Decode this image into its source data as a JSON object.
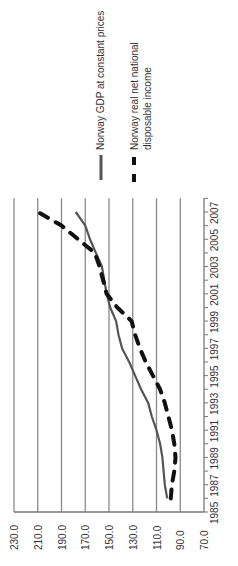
{
  "chart_data": {
    "type": "line",
    "title": "",
    "xlabel": "",
    "ylabel": "",
    "rotation": "chart rotated 90 degrees counter-clockwise",
    "x": [
      1986,
      1987,
      1988,
      1989,
      1990,
      1991,
      1992,
      1993,
      1994,
      1995,
      1996,
      1997,
      1998,
      1999,
      2000,
      2001,
      2002,
      2003,
      2004,
      2005,
      2006,
      2007
    ],
    "x_tick_labels": [
      "1985",
      "1987",
      "1989",
      "1991",
      "1993",
      "1995",
      "1997",
      "1999",
      "2001",
      "2003",
      "2005",
      "2007"
    ],
    "y_tick_labels": [
      "70.0",
      "90.0",
      "110.0",
      "130.0",
      "150.0",
      "170.0",
      "190.0",
      "210.0",
      "230.0"
    ],
    "ylim": [
      70,
      230
    ],
    "xlim": [
      1985,
      2008
    ],
    "grid": true,
    "legend_position": "right (top in rotated image)",
    "series": [
      {
        "name": "Norway GDP at constant prices",
        "style": "solid",
        "color": "#555555",
        "values": [
          101,
          103,
          104,
          105,
          107,
          110,
          114,
          117,
          123,
          128,
          133,
          139,
          142,
          144,
          149,
          152,
          154,
          156,
          161,
          166,
          170,
          178
        ]
      },
      {
        "name": "Norway real net national disposable income",
        "style": "dashed",
        "color": "#111111",
        "values": [
          98,
          97,
          95,
          94,
          95,
          97,
          100,
          103,
          107,
          113,
          119,
          124,
          128,
          131,
          143,
          152,
          155,
          158,
          162,
          176,
          190,
          210
        ]
      }
    ]
  },
  "legend": {
    "items": [
      {
        "label": "Norway GDP at constant prices"
      },
      {
        "label_line1": "Norway real net national",
        "label_line2": "disposable income"
      }
    ]
  }
}
